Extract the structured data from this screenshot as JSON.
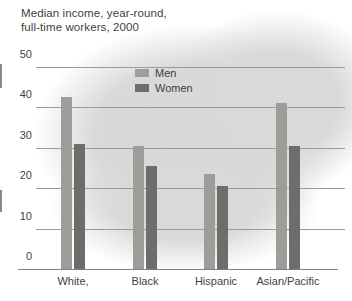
{
  "title_display": "Median income, year-round,\nfull-time workers, 2000",
  "chart_data": {
    "type": "bar",
    "title": "Median income, year-round, full-time workers, 2000",
    "categories": [
      "White,",
      "Black",
      "Hispanic",
      "Asian/Pacific"
    ],
    "series": [
      {
        "name": "Men",
        "color": "#9b9e99",
        "values": [
          42.5,
          30.5,
          23.5,
          41
        ]
      },
      {
        "name": "Women",
        "color": "#6e6d6c",
        "values": [
          31,
          25.5,
          20.5,
          30.5
        ]
      }
    ],
    "xlabel": "",
    "ylabel": "",
    "ylim": [
      0,
      50
    ],
    "yticks": [
      50,
      40,
      30,
      20,
      10,
      0
    ],
    "grid": true,
    "legend_position": "inside-top-center"
  },
  "colors": {
    "background_blob": "#d8d9d8",
    "gridline": "#9a9a9a",
    "axis_line": "#828282",
    "text": "#3f3f3f"
  }
}
